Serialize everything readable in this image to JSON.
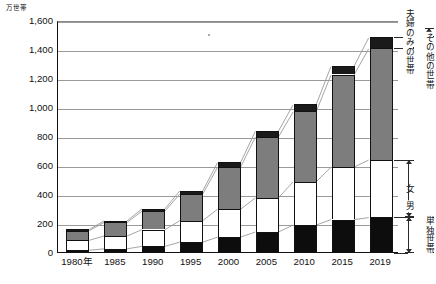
{
  "chart_data": {
    "type": "bar",
    "stacked": true,
    "title": "",
    "subtitle": "",
    "xlabel": "",
    "ylabel": "万世帯",
    "unit_label": "万世帯",
    "ylim": [
      0,
      1600
    ],
    "yticks": [
      0,
      200,
      400,
      600,
      800,
      1000,
      1200,
      1400,
      1600
    ],
    "ytick_labels": [
      "0",
      "200",
      "400",
      "600",
      "800",
      "1,000",
      "1,200",
      "1,400",
      "1,600"
    ],
    "grid": true,
    "legend_position": "right-brackets",
    "categories": [
      "1980年",
      "1985",
      "1990",
      "1995",
      "2000",
      "2005",
      "2010",
      "2015",
      "2019"
    ],
    "x": [
      1980,
      1985,
      1990,
      1995,
      2000,
      2005,
      2010,
      2015,
      2019
    ],
    "series": [
      {
        "name": "男",
        "group": "単独世帯",
        "color": "#0d0d0d",
        "values": [
          19,
          29,
          46,
          75,
          110,
          145,
          193,
          231,
          245
        ]
      },
      {
        "name": "女",
        "group": "単独世帯",
        "color": "#ffffff",
        "values": [
          69,
          89,
          116,
          149,
          193,
          236,
          299,
          363,
          399
        ]
      },
      {
        "name": "夫婦のみの世帯",
        "group": "夫婦のみの世帯",
        "color": "#7d7d7d",
        "values": [
          67,
          94,
          128,
          184,
          290,
          421,
          484,
          637,
          770
        ]
      },
      {
        "name": "その他の世帯",
        "group": "その他の世帯",
        "color": "#1a1a1a",
        "values": [
          8,
          11,
          15,
          22,
          32,
          40,
          49,
          59,
          76
        ]
      }
    ],
    "totals": [
      163,
      223,
      305,
      430,
      625,
      842,
      1025,
      1290,
      1490
    ],
    "annotations": [
      {
        "text": "その他の世帯",
        "kind": "bracket-outer",
        "covers": [
          "その他の世帯"
        ]
      },
      {
        "text": "夫婦のみの世帯",
        "kind": "bracket-inner",
        "covers": [
          "夫婦のみの世帯"
        ]
      },
      {
        "text": "単独世帯",
        "kind": "bracket-outer",
        "covers": [
          "女",
          "男"
        ]
      },
      {
        "text": "女",
        "kind": "bracket-inner",
        "covers": [
          "女"
        ]
      },
      {
        "text": "男",
        "kind": "bracket-inner",
        "covers": [
          "男"
        ]
      }
    ]
  },
  "axis": {
    "unit": "万世帯",
    "y_labels": [
      "1,600",
      "1,400",
      "1,200",
      "1,000",
      "800",
      "600",
      "400",
      "200",
      "0"
    ],
    "x_labels": [
      "1980年",
      "1985",
      "1990",
      "1995",
      "2000",
      "2005",
      "2010",
      "2015",
      "2019"
    ]
  },
  "brackets": {
    "other_households": "その他の世帯",
    "couple_only": "夫婦のみの世帯",
    "single_households": "単独世帯",
    "female": "女",
    "male": "男"
  }
}
